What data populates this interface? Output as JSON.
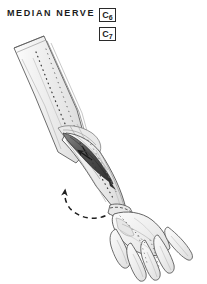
{
  "figure": {
    "title": "MEDIAN NERVE",
    "background_color": "#ffffff",
    "ink_color": "#2a2a2a",
    "skin_fill": "#efefef",
    "muscle_fill": "#5a5a5a",
    "nerve_color": "#3a3a3a",
    "view": "right upper limb, anterior (palmar) view"
  },
  "root_labels": [
    {
      "level": "C",
      "number": "6",
      "text": "C6"
    },
    {
      "level": "C",
      "number": "7",
      "text": "C7"
    }
  ],
  "anatomy": {
    "upper_arm_label": "upper-arm",
    "elbow_label": "elbow",
    "forearm_label": "forearm",
    "wrist_label": "wrist",
    "hand_label": "hand",
    "muscle_label": "forearm-muscle-belly",
    "nerve_path_label": "median-nerve-path",
    "rotation_arrow_label": "forearm-rotation-arrow",
    "muscle_arrow_label": "muscle-test-arrow"
  }
}
